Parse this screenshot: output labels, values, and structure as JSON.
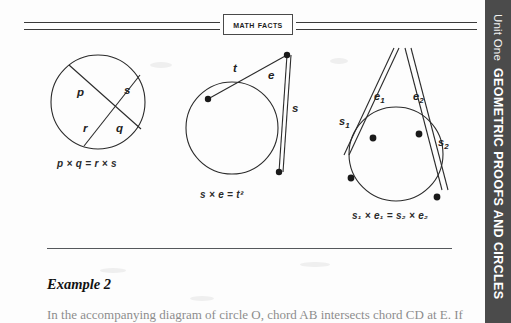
{
  "banner": {
    "label": "Math Facts"
  },
  "figures": [
    {
      "id": "intersecting-chords",
      "name": "intersecting-chords-figure",
      "labels": [
        "p",
        "s",
        "r",
        "q"
      ],
      "formula": "p × q = r × s"
    },
    {
      "id": "tangent-secant",
      "name": "tangent-secant-figure",
      "labels": [
        "t",
        "e",
        "s"
      ],
      "formula": "s × e = t²"
    },
    {
      "id": "two-secants",
      "name": "two-secants-figure",
      "labels": [
        "s₁",
        "e₁",
        "e₂",
        "s₂"
      ],
      "formula": "s₁ × e₁ = s₂ × e₂"
    }
  ],
  "example": {
    "title": "Example 2",
    "body_prefix": "In the accompanying diagram of circle O, chord ",
    "body_seg1": "AB",
    "body_mid": " intersects chord ",
    "body_seg2": "CD",
    "body_suffix": " at E. If"
  },
  "unit_tab": {
    "unit_label": "Unit One",
    "unit_title": "GEOMETRIC PROOFS AND CIRCLES",
    "background": "#4b4b4b"
  },
  "colors": {
    "ink": "#1a1a1a",
    "rule": "#55585c",
    "page": "#fdfdfd"
  }
}
